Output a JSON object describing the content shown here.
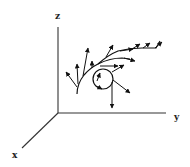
{
  "diagram": {
    "type": "3d-vector-field-along-curve",
    "axes": {
      "z": {
        "label": "z"
      },
      "y": {
        "label": "y"
      },
      "x": {
        "label": "x"
      }
    },
    "elements": [
      "curved path with branching tangent/normal arrows",
      "circular loop with arrows",
      "downward vector from loop"
    ]
  }
}
